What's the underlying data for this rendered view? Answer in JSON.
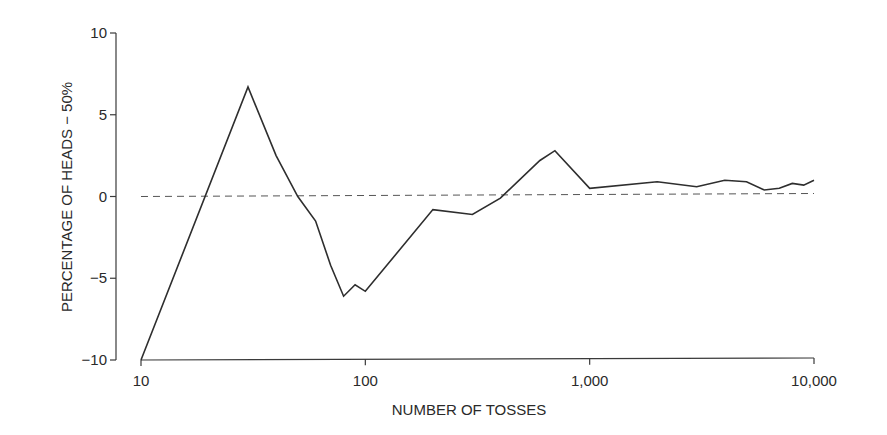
{
  "chart_data": {
    "type": "line",
    "title": "",
    "xlabel": "NUMBER OF TOSSES",
    "ylabel": "PERCENTAGE OF HEADS − 50%",
    "x_scale": "log",
    "xlim": [
      10,
      10000
    ],
    "ylim": [
      -10,
      10
    ],
    "x_ticks": [
      10,
      100,
      1000,
      10000
    ],
    "x_tick_labels": [
      "10",
      "100",
      "1,000",
      "10,000"
    ],
    "y_ticks": [
      10,
      5,
      0,
      -5,
      -10
    ],
    "y_tick_labels": [
      "10",
      "5",
      "0",
      "−5",
      "−10"
    ],
    "grid": false,
    "legend": null,
    "reference_line": {
      "y": 0,
      "style": "dashed"
    },
    "series": [
      {
        "name": "Percentage of heads minus 50%",
        "x": [
          10,
          30,
          40,
          50,
          60,
          70,
          80,
          90,
          100,
          200,
          300,
          400,
          600,
          700,
          1000,
          2000,
          3000,
          4000,
          5000,
          6000,
          7000,
          8000,
          9000,
          10000
        ],
        "values": [
          -10,
          6.7,
          2.5,
          0,
          -1.5,
          -4.2,
          -6.1,
          -5.4,
          -5.8,
          -0.8,
          -1.1,
          -0.1,
          2.2,
          2.8,
          0.5,
          0.9,
          0.6,
          1.0,
          0.9,
          0.4,
          0.5,
          0.8,
          0.7,
          1.0
        ]
      }
    ]
  },
  "colors": {
    "line": "#2e2e2e",
    "axis": "#3a3a3a",
    "reference": "#555555",
    "background": "#ffffff"
  }
}
